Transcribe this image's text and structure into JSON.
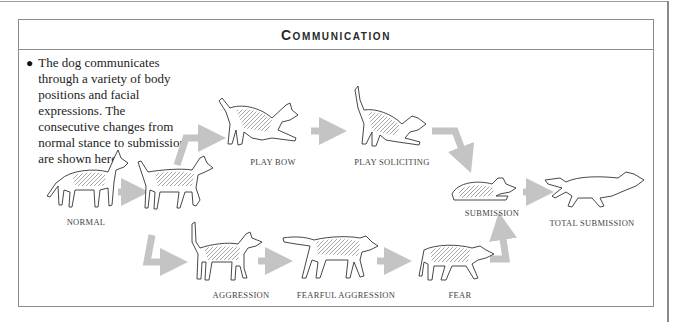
{
  "panel": {
    "title": "Communication"
  },
  "intro": {
    "bullet": "●",
    "text": "The dog communicates through a variety of body positions and facial expressions. The consecutive changes from normal stance to submission are shown here."
  },
  "stages": {
    "normal": {
      "label": "NORMAL",
      "x": 86,
      "y": 217
    },
    "play_bow": {
      "label": "PLAY BOW",
      "x": 273,
      "y": 160
    },
    "play_soliciting": {
      "label": "PLAY SOLICITING",
      "x": 392,
      "y": 160
    },
    "submission": {
      "label": "SUBMISSION",
      "x": 492,
      "y": 210
    },
    "total_submission": {
      "label": "TOTAL SUBMISSION",
      "x": 590,
      "y": 221
    },
    "aggression": {
      "label": "AGGRESSION",
      "x": 241,
      "y": 292
    },
    "fearful_aggression": {
      "label": "FEARFUL AGGRESSION",
      "x": 346,
      "y": 292
    },
    "fear": {
      "label": "FEAR",
      "x": 461,
      "y": 292
    }
  },
  "colors": {
    "arrow": "#c4c4c4",
    "border": "#8c8c8c",
    "ink": "#333333"
  }
}
